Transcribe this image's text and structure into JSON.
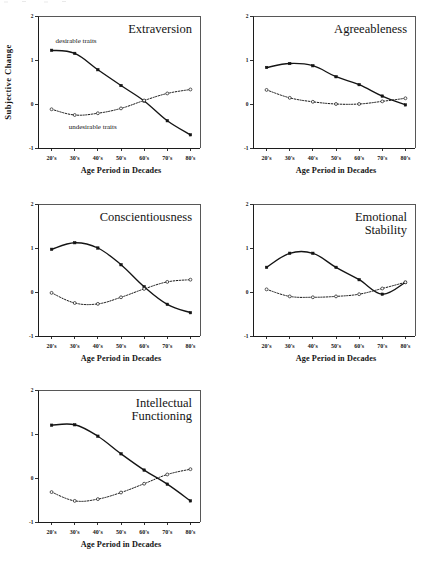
{
  "figure": {
    "axis_x_title": "Age Period in Decades",
    "axis_y_title": "Subjective Change",
    "categories": [
      "20's",
      "30's",
      "40's",
      "50's",
      "60's",
      "70's",
      "80's"
    ],
    "y_ticks": [
      "2",
      "1",
      "0",
      "-1"
    ],
    "y_tick_values": [
      2,
      1,
      0,
      -1
    ],
    "ylim": [
      -1,
      2
    ],
    "series_names": [
      "desirable traits",
      "undesirable traits"
    ],
    "annotations": {
      "desirable": "desirable traits",
      "undesirable": "undesirable traits"
    }
  },
  "panels": [
    {
      "title": "Extraversion",
      "title_line1": "Extraversion",
      "title_line2": "",
      "show_ylabel": true,
      "show_annotations": true
    },
    {
      "title": "Agreeableness",
      "title_line1": "Agreeableness",
      "title_line2": "",
      "show_ylabel": false,
      "show_annotations": false
    },
    {
      "title": "Conscientiousness",
      "title_line1": "Conscientiousness",
      "title_line2": "",
      "show_ylabel": false,
      "show_annotations": false
    },
    {
      "title": "Emotional Stability",
      "title_line1": "Emotional",
      "title_line2": "Stability",
      "show_ylabel": false,
      "show_annotations": false
    },
    {
      "title": "Intellectual Functioning",
      "title_line1": "Intellectual",
      "title_line2": "Functioning",
      "show_ylabel": false,
      "show_annotations": false
    }
  ],
  "chart_data": [
    {
      "type": "line",
      "title": "Extraversion",
      "xlabel": "Age Period in Decades",
      "ylabel": "Subjective Change",
      "categories": [
        "20's",
        "30's",
        "40's",
        "50's",
        "60's",
        "70's",
        "80's"
      ],
      "ylim": [
        -1,
        2
      ],
      "yticks": [
        -1,
        0,
        1,
        2
      ],
      "grid": false,
      "legend": "inline annotations",
      "series": [
        {
          "name": "desirable traits",
          "style": "solid",
          "marker": "filled-square",
          "values": [
            1.22,
            1.15,
            0.78,
            0.42,
            0.07,
            -0.38,
            -0.7
          ]
        },
        {
          "name": "undesirable traits",
          "style": "dotted",
          "marker": "open-circle",
          "values": [
            -0.12,
            -0.25,
            -0.21,
            -0.1,
            0.08,
            0.24,
            0.33
          ]
        }
      ]
    },
    {
      "type": "line",
      "title": "Agreeableness",
      "xlabel": "Age Period in Decades",
      "ylabel": "Subjective Change",
      "categories": [
        "20's",
        "30's",
        "40's",
        "50's",
        "60's",
        "70's",
        "80's"
      ],
      "ylim": [
        -1,
        2
      ],
      "yticks": [
        -1,
        0,
        1,
        2
      ],
      "grid": false,
      "legend": "none",
      "series": [
        {
          "name": "desirable traits",
          "style": "solid",
          "marker": "filled-square",
          "values": [
            0.83,
            0.92,
            0.87,
            0.62,
            0.44,
            0.18,
            -0.02
          ]
        },
        {
          "name": "undesirable traits",
          "style": "dotted",
          "marker": "open-circle",
          "values": [
            0.32,
            0.14,
            0.05,
            0.0,
            0.0,
            0.06,
            0.13
          ]
        }
      ]
    },
    {
      "type": "line",
      "title": "Conscientiousness",
      "xlabel": "Age Period in Decades",
      "ylabel": "Subjective Change",
      "categories": [
        "20's",
        "30's",
        "40's",
        "50's",
        "60's",
        "70's",
        "80's"
      ],
      "ylim": [
        -1,
        2
      ],
      "yticks": [
        -1,
        0,
        1,
        2
      ],
      "grid": false,
      "legend": "none",
      "series": [
        {
          "name": "desirable traits",
          "style": "solid",
          "marker": "filled-square",
          "values": [
            0.97,
            1.12,
            1.0,
            0.62,
            0.12,
            -0.28,
            -0.47
          ]
        },
        {
          "name": "undesirable traits",
          "style": "dotted",
          "marker": "open-circle",
          "values": [
            -0.02,
            -0.25,
            -0.27,
            -0.12,
            0.07,
            0.23,
            0.28
          ]
        }
      ]
    },
    {
      "type": "line",
      "title": "Emotional Stability",
      "xlabel": "Age Period in Decades",
      "ylabel": "Subjective Change",
      "categories": [
        "20's",
        "30's",
        "40's",
        "50's",
        "60's",
        "70's",
        "80's"
      ],
      "ylim": [
        -1,
        2
      ],
      "yticks": [
        -1,
        0,
        1,
        2
      ],
      "grid": false,
      "legend": "none",
      "series": [
        {
          "name": "desirable traits",
          "style": "solid",
          "marker": "filled-square",
          "values": [
            0.56,
            0.88,
            0.88,
            0.56,
            0.28,
            -0.05,
            0.22
          ]
        },
        {
          "name": "undesirable traits",
          "style": "dotted",
          "marker": "open-circle",
          "values": [
            0.06,
            -0.1,
            -0.12,
            -0.1,
            -0.05,
            0.08,
            0.22
          ]
        }
      ]
    },
    {
      "type": "line",
      "title": "Intellectual Functioning",
      "xlabel": "Age Period in Decades",
      "ylabel": "Subjective Change",
      "categories": [
        "20's",
        "30's",
        "40's",
        "50's",
        "60's",
        "70's",
        "80's"
      ],
      "ylim": [
        -1,
        2
      ],
      "yticks": [
        -1,
        0,
        1,
        2
      ],
      "grid": false,
      "legend": "none",
      "series": [
        {
          "name": "desirable traits",
          "style": "solid",
          "marker": "filled-square",
          "values": [
            1.2,
            1.21,
            0.95,
            0.55,
            0.18,
            -0.14,
            -0.52
          ]
        },
        {
          "name": "undesirable traits",
          "style": "dotted",
          "marker": "open-circle",
          "values": [
            -0.32,
            -0.52,
            -0.48,
            -0.33,
            -0.13,
            0.08,
            0.2
          ]
        }
      ]
    }
  ]
}
